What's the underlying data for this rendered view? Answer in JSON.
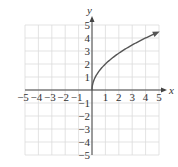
{
  "chart_data": {
    "type": "line",
    "title": "",
    "function": "y = 2*sqrt(x)",
    "xlabel": "x",
    "ylabel": "y",
    "xlim": [
      -5,
      5
    ],
    "ylim": [
      -5,
      5
    ],
    "grid": true,
    "x_ticks": [
      "-5",
      "-4",
      "-3",
      "-2",
      "-1",
      "1",
      "2",
      "3",
      "4",
      "5"
    ],
    "y_ticks": [
      "5",
      "4",
      "3",
      "2",
      "1",
      "-1",
      "-2",
      "-3",
      "-4",
      "-5"
    ],
    "series": [
      {
        "name": "curve",
        "x": [
          0,
          0.25,
          0.5,
          1,
          2,
          3,
          4,
          5
        ],
        "y": [
          0,
          1.0,
          1.41,
          2.0,
          2.83,
          3.46,
          4.0,
          4.47
        ],
        "arrow_end": true
      }
    ]
  },
  "colors": {
    "curve": "#555555",
    "axis": "#444444",
    "grid": "#dcdcdc"
  }
}
